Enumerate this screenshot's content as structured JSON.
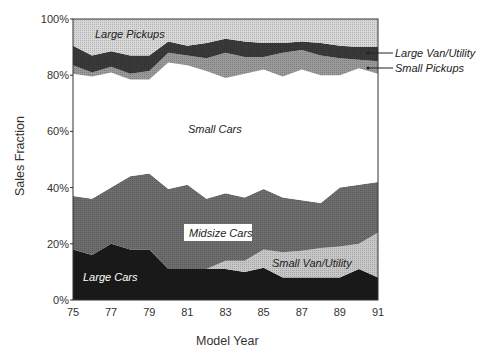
{
  "chart_data": {
    "type": "area",
    "stacked": true,
    "title": "",
    "xlabel": "Model Year",
    "ylabel": "Sales Fraction",
    "x": [
      75,
      76,
      77,
      78,
      79,
      80,
      81,
      82,
      83,
      84,
      85,
      86,
      87,
      88,
      89,
      90,
      91
    ],
    "x_ticks": [
      "75",
      "77",
      "79",
      "81",
      "83",
      "85",
      "87",
      "89",
      "91"
    ],
    "y_ticks": [
      "0%",
      "20%",
      "40%",
      "60%",
      "80%",
      "100%"
    ],
    "ylim": [
      0,
      100
    ],
    "grid": false,
    "series": [
      {
        "name": "Large Cars",
        "color": "#1a1a1a",
        "values": [
          18,
          16,
          20,
          18,
          18,
          11,
          11,
          11,
          11,
          10,
          11.5,
          8,
          8,
          8,
          8,
          11,
          8
        ]
      },
      {
        "name": "Small Van/Utility",
        "color": "#c8c8c8",
        "values": [
          0,
          0,
          0,
          0,
          0,
          0,
          0,
          0,
          3,
          4,
          6.5,
          9,
          9.5,
          10.5,
          11,
          9,
          16
        ]
      },
      {
        "name": "Midsize Cars",
        "color": "#6e6e6e",
        "values": [
          19,
          20,
          20,
          26,
          27,
          28.5,
          30,
          25,
          24,
          22.5,
          21.5,
          19.5,
          18,
          16,
          21,
          21,
          18
        ]
      },
      {
        "name": "Small Cars",
        "color": "#ffffff",
        "values": [
          43.5,
          43.5,
          41,
          34.5,
          33.5,
          45,
          42.5,
          45.5,
          41,
          44,
          42.5,
          43,
          46.5,
          45.5,
          40,
          41.5,
          38.5
        ]
      },
      {
        "name": "Small Pickups",
        "color": "#9a9a9a",
        "values": [
          3,
          1.5,
          2,
          2,
          3,
          3.5,
          3.5,
          4.5,
          9,
          6,
          4.5,
          8.5,
          7,
          7,
          6,
          3,
          4.5
        ]
      },
      {
        "name": "Large Van/Utility",
        "color": "#3a3a3a",
        "values": [
          7,
          6,
          5.5,
          6.5,
          5.5,
          4,
          3.5,
          5.5,
          5,
          5.5,
          5,
          3.5,
          3,
          4.5,
          4.5,
          4.5,
          5
        ]
      },
      {
        "name": "Large Pickups",
        "color": "#d8d8d8",
        "values": [
          9.5,
          13,
          11.5,
          13,
          13,
          8,
          9.5,
          8.5,
          7,
          8,
          8.5,
          8.5,
          8,
          8.5,
          9.5,
          10,
          10
        ]
      }
    ],
    "annotations": [
      "Large Pickups",
      "Large Van/Utility",
      "Small Pickups",
      "Small Cars",
      "Midsize Cars",
      "Small Van/Utility",
      "Large Cars"
    ]
  },
  "labels": {
    "large_pickups": "Large Pickups",
    "large_van": "Large Van/Utility",
    "small_pickups": "Small Pickups",
    "small_cars": "Small Cars",
    "midsize": "Midsize Cars",
    "small_van": "Small Van/Utility",
    "large_cars": "Large Cars",
    "xlabel": "Model Year",
    "ylabel": "Sales Fraction"
  }
}
